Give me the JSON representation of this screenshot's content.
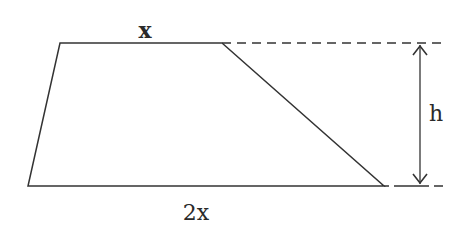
{
  "diagram": {
    "type": "trapezoid",
    "labels": {
      "top": "x",
      "bottom": "2x",
      "height": "h"
    },
    "colors": {
      "stroke": "#333333",
      "background": "#ffffff"
    }
  }
}
